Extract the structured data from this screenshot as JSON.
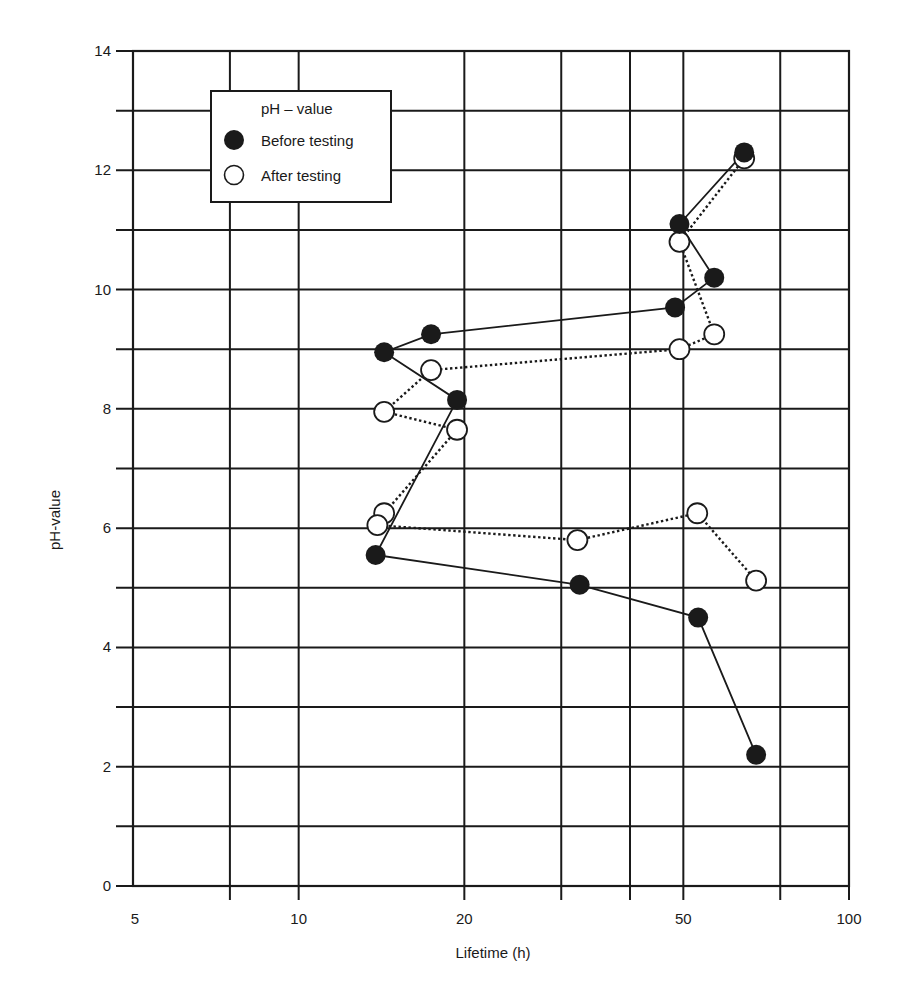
{
  "chart_data": {
    "type": "line",
    "title": "",
    "xlabel": "Lifetime (h)",
    "ylabel": "pH-value",
    "xscale": "log",
    "xlim": [
      5,
      100
    ],
    "ylim": [
      0,
      14
    ],
    "x_ticks": [
      5,
      10,
      20,
      50,
      100
    ],
    "x_tick_labels": [
      "5",
      "10",
      "20",
      "50",
      "100"
    ],
    "x_gridlines": [
      5,
      7.5,
      10,
      20,
      30,
      40,
      50,
      75,
      100
    ],
    "y_ticks": [
      0,
      2,
      4,
      6,
      8,
      10,
      12,
      14
    ],
    "y_tick_labels": [
      "0",
      "2",
      "4",
      "6",
      "8",
      "10",
      "12",
      "14"
    ],
    "y_gridlines": [
      0,
      1,
      2,
      3,
      4,
      5,
      6,
      7,
      8,
      9,
      10,
      11,
      12,
      13,
      14
    ],
    "grid": true,
    "legend": {
      "title": "pH – value",
      "position": "upper-left",
      "entries": [
        "Before testing",
        "After testing"
      ]
    },
    "series": [
      {
        "name": "Before testing",
        "marker": "filled-circle",
        "line": "solid",
        "points": [
          {
            "x": 64.5,
            "y": 12.3
          },
          {
            "x": 49.2,
            "y": 11.1
          },
          {
            "x": 56.9,
            "y": 10.2
          },
          {
            "x": 48.3,
            "y": 9.7
          },
          {
            "x": 17.4,
            "y": 9.25
          },
          {
            "x": 14.3,
            "y": 8.95
          },
          {
            "x": 19.4,
            "y": 8.15
          },
          {
            "x": 13.8,
            "y": 5.55
          },
          {
            "x": 32.4,
            "y": 5.05
          },
          {
            "x": 53.2,
            "y": 4.5
          },
          {
            "x": 67.8,
            "y": 2.2
          }
        ]
      },
      {
        "name": "After testing",
        "marker": "open-circle",
        "line": "dotted",
        "points": [
          {
            "x": 64.5,
            "y": 12.2
          },
          {
            "x": 49.2,
            "y": 10.8
          },
          {
            "x": 56.9,
            "y": 9.25
          },
          {
            "x": 49.2,
            "y": 9.0
          },
          {
            "x": 17.4,
            "y": 8.65
          },
          {
            "x": 14.3,
            "y": 7.95
          },
          {
            "x": 19.4,
            "y": 7.65
          },
          {
            "x": 14.3,
            "y": 6.25
          },
          {
            "x": 13.9,
            "y": 6.05
          },
          {
            "x": 32.1,
            "y": 5.8
          },
          {
            "x": 53.0,
            "y": 6.25
          },
          {
            "x": 67.8,
            "y": 5.12
          }
        ]
      }
    ]
  },
  "colors": {
    "ink": "#1a1a1a",
    "background": "#ffffff"
  }
}
